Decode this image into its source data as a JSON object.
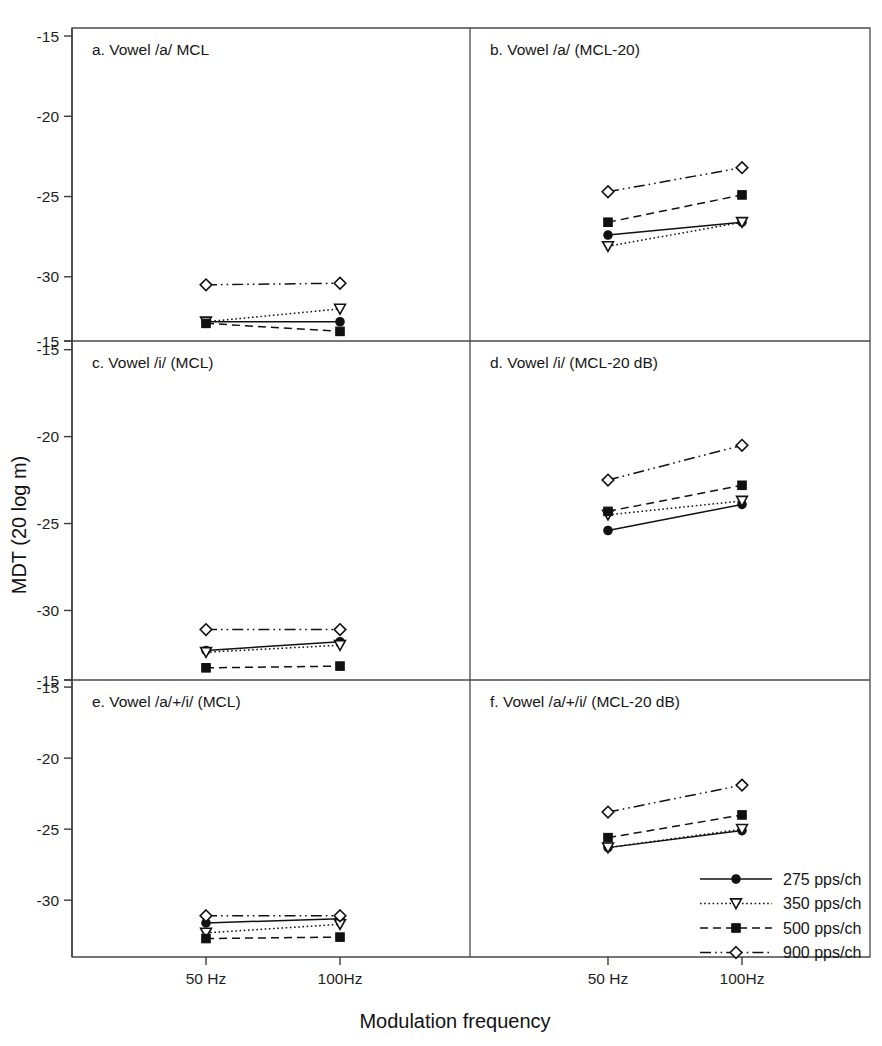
{
  "figure": {
    "xlabel": "Modulation frequency",
    "ylabel": "MDT (20 log m)",
    "x_tick_labels": [
      "50 Hz",
      "100Hz"
    ],
    "y_tick_labels": [
      "-15",
      "-20",
      "-25",
      "-30"
    ],
    "y_tick_values": [
      -15,
      -20,
      -25,
      -30
    ],
    "ylim": [
      -34,
      -14.5
    ],
    "grid": false,
    "legend_position": "inside panel f, lower right",
    "line_color": "#111111",
    "frame_color": "#4a4a4a"
  },
  "legend": {
    "entries": [
      {
        "label": "275 pps/ch",
        "marker": "filled-circle",
        "linestyle": "solid"
      },
      {
        "label": "350 pps/ch",
        "marker": "open-triangle-down",
        "linestyle": "dotted"
      },
      {
        "label": "500 pps/ch",
        "marker": "filled-square",
        "linestyle": "dashed"
      },
      {
        "label": "900 pps/ch",
        "marker": "open-diamond",
        "linestyle": "dash-dot-dot"
      }
    ]
  },
  "chart_data": [
    {
      "type": "line",
      "panel": "a",
      "title": "a. Vowel /a/ MCL",
      "categories": [
        "50 Hz",
        "100Hz"
      ],
      "xlabel": "",
      "ylabel": "MDT (20 log m)",
      "ylim": [
        -34,
        -14.5
      ],
      "series": [
        {
          "name": "275 pps/ch",
          "values": [
            -32.8,
            -32.8
          ],
          "marker": "filled-circle",
          "linestyle": "solid"
        },
        {
          "name": "350 pps/ch",
          "values": [
            -32.8,
            -32.0
          ],
          "marker": "open-triangle-down",
          "linestyle": "dotted"
        },
        {
          "name": "500 pps/ch",
          "values": [
            -32.9,
            -33.4
          ],
          "marker": "filled-square",
          "linestyle": "dashed"
        },
        {
          "name": "900 pps/ch",
          "values": [
            -30.5,
            -30.4
          ],
          "marker": "open-diamond",
          "linestyle": "dash-dot-dot"
        }
      ]
    },
    {
      "type": "line",
      "panel": "b",
      "title": "b. Vowel /a/ (MCL-20)",
      "categories": [
        "50 Hz",
        "100Hz"
      ],
      "xlabel": "",
      "ylabel": "MDT (20 log m)",
      "ylim": [
        -34,
        -14.5
      ],
      "series": [
        {
          "name": "275 pps/ch",
          "values": [
            -27.4,
            -26.6
          ],
          "marker": "filled-circle",
          "linestyle": "solid"
        },
        {
          "name": "350 pps/ch",
          "values": [
            -28.1,
            -26.6
          ],
          "marker": "open-triangle-down",
          "linestyle": "dotted"
        },
        {
          "name": "500 pps/ch",
          "values": [
            -26.6,
            -24.9
          ],
          "marker": "filled-square",
          "linestyle": "dashed"
        },
        {
          "name": "900 pps/ch",
          "values": [
            -24.7,
            -23.2
          ],
          "marker": "open-diamond",
          "linestyle": "dash-dot-dot"
        }
      ]
    },
    {
      "type": "line",
      "panel": "c",
      "title": "c. Vowel /i/ (MCL)",
      "categories": [
        "50 Hz",
        "100Hz"
      ],
      "xlabel": "",
      "ylabel": "MDT (20 log m)",
      "ylim": [
        -34,
        -14.5
      ],
      "series": [
        {
          "name": "275 pps/ch",
          "values": [
            -32.3,
            -31.8
          ],
          "marker": "filled-circle",
          "linestyle": "solid"
        },
        {
          "name": "350 pps/ch",
          "values": [
            -32.4,
            -32.0
          ],
          "marker": "open-triangle-down",
          "linestyle": "dotted"
        },
        {
          "name": "500 pps/ch",
          "values": [
            -33.3,
            -33.2
          ],
          "marker": "filled-square",
          "linestyle": "dashed"
        },
        {
          "name": "900 pps/ch",
          "values": [
            -31.1,
            -31.1
          ],
          "marker": "open-diamond",
          "linestyle": "dash-dot-dot"
        }
      ]
    },
    {
      "type": "line",
      "panel": "d",
      "title": "d. Vowel /i/ (MCL-20 dB)",
      "categories": [
        "50 Hz",
        "100Hz"
      ],
      "xlabel": "",
      "ylabel": "MDT (20 log m)",
      "ylim": [
        -34,
        -14.5
      ],
      "series": [
        {
          "name": "275 pps/ch",
          "values": [
            -25.4,
            -23.9
          ],
          "marker": "filled-circle",
          "linestyle": "solid"
        },
        {
          "name": "350 pps/ch",
          "values": [
            -24.5,
            -23.7
          ],
          "marker": "open-triangle-down",
          "linestyle": "dotted"
        },
        {
          "name": "500 pps/ch",
          "values": [
            -24.3,
            -22.8
          ],
          "marker": "filled-square",
          "linestyle": "dashed"
        },
        {
          "name": "900 pps/ch",
          "values": [
            -22.5,
            -20.5
          ],
          "marker": "open-diamond",
          "linestyle": "dash-dot-dot"
        }
      ]
    },
    {
      "type": "line",
      "panel": "e",
      "title": "e. Vowel /a/+/i/ (MCL)",
      "categories": [
        "50 Hz",
        "100Hz"
      ],
      "xlabel": "",
      "ylabel": "MDT (20 log m)",
      "ylim": [
        -34,
        -14.5
      ],
      "series": [
        {
          "name": "275 pps/ch",
          "values": [
            -31.6,
            -31.3
          ],
          "marker": "filled-circle",
          "linestyle": "solid"
        },
        {
          "name": "350 pps/ch",
          "values": [
            -32.3,
            -31.7
          ],
          "marker": "open-triangle-down",
          "linestyle": "dotted"
        },
        {
          "name": "500 pps/ch",
          "values": [
            -32.7,
            -32.6
          ],
          "marker": "filled-square",
          "linestyle": "dashed"
        },
        {
          "name": "900 pps/ch",
          "values": [
            -31.1,
            -31.1
          ],
          "marker": "open-diamond",
          "linestyle": "dash-dot-dot"
        }
      ]
    },
    {
      "type": "line",
      "panel": "f",
      "title": "f. Vowel /a/+/i/ (MCL-20 dB)",
      "categories": [
        "50 Hz",
        "100Hz"
      ],
      "xlabel": "",
      "ylabel": "MDT (20 log m)",
      "ylim": [
        -34,
        -14.5
      ],
      "series": [
        {
          "name": "275 pps/ch",
          "values": [
            -26.3,
            -25.1
          ],
          "marker": "filled-circle",
          "linestyle": "solid"
        },
        {
          "name": "350 pps/ch",
          "values": [
            -26.3,
            -25.0
          ],
          "marker": "open-triangle-down",
          "linestyle": "dotted"
        },
        {
          "name": "500 pps/ch",
          "values": [
            -25.6,
            -24.0
          ],
          "marker": "filled-square",
          "linestyle": "dashed"
        },
        {
          "name": "900 pps/ch",
          "values": [
            -23.8,
            -21.9
          ],
          "marker": "open-diamond",
          "linestyle": "dash-dot-dot"
        }
      ]
    }
  ]
}
